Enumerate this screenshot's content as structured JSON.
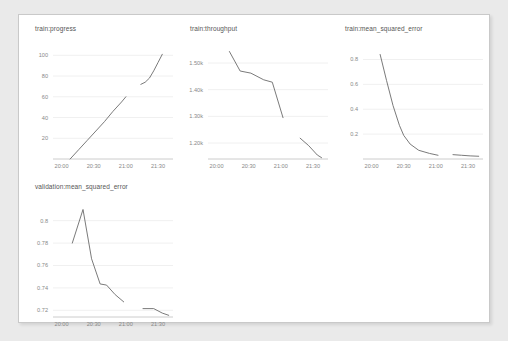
{
  "page": {
    "background_color": "#eaeaea",
    "card_background_color": "#ffffff",
    "card_border_color": "#c9c9c9"
  },
  "style": {
    "line_color": "#6b6b6b",
    "grid_color": "#f0f0f0",
    "axis_color": "#cccccc",
    "tick_label_color": "#888888",
    "title_color": "#555555"
  },
  "chart_data": [
    {
      "type": "line",
      "title": "train:progress",
      "xlabel": "",
      "ylabel": "",
      "grid": true,
      "legend": "none",
      "yticks": [
        "20",
        "40",
        "60",
        "80",
        "100"
      ],
      "ytick_values": [
        20,
        40,
        60,
        80,
        100
      ],
      "ylim": [
        0,
        108
      ],
      "xticks": [
        "20:00",
        "20:30",
        "21:00",
        "21:30"
      ],
      "xtick_values": [
        0,
        30,
        60,
        90
      ],
      "xlim": [
        -8,
        104
      ],
      "series": [
        {
          "name": "run-1",
          "x": [
            8,
            16,
            24,
            32,
            40,
            48,
            56,
            60
          ],
          "values": [
            0,
            9,
            18,
            27,
            36,
            46,
            55,
            60
          ]
        },
        {
          "name": "run-2",
          "x": [
            74,
            78,
            82,
            86,
            90,
            94
          ],
          "values": [
            72,
            74,
            78,
            85,
            93,
            101
          ]
        }
      ]
    },
    {
      "type": "line",
      "title": "train:throughput",
      "xlabel": "",
      "ylabel": "",
      "grid": true,
      "legend": "none",
      "yticks": [
        "1.20k",
        "1.30k",
        "1.40k",
        "1.50k"
      ],
      "ytick_values": [
        1200,
        1300,
        1400,
        1500
      ],
      "ylim": [
        1140,
        1560
      ],
      "xticks": [
        "20:00",
        "20:30",
        "21:00",
        "21:30"
      ],
      "xtick_values": [
        0,
        30,
        60,
        90
      ],
      "xlim": [
        -8,
        104
      ],
      "series": [
        {
          "name": "run-1",
          "x": [
            12,
            22,
            32,
            44,
            52,
            62
          ],
          "values": [
            1543,
            1470,
            1462,
            1437,
            1428,
            1295
          ]
        },
        {
          "name": "run-2",
          "x": [
            78,
            86,
            94,
            98
          ],
          "values": [
            1218,
            1190,
            1155,
            1145
          ]
        }
      ]
    },
    {
      "type": "line",
      "title": "train:mean_squared_error",
      "xlabel": "",
      "ylabel": "",
      "grid": true,
      "legend": "none",
      "yticks": [
        "0.2",
        "0.4",
        "0.6",
        "0.8"
      ],
      "ytick_values": [
        0.2,
        0.4,
        0.6,
        0.8
      ],
      "ylim": [
        0.0,
        0.9
      ],
      "xticks": [
        "20:00",
        "20:30",
        "21:00",
        "21:30"
      ],
      "xtick_values": [
        0,
        30,
        60,
        90
      ],
      "xlim": [
        -8,
        104
      ],
      "series": [
        {
          "name": "run-1",
          "x": [
            8,
            14,
            20,
            26,
            30,
            36,
            44,
            54,
            62
          ],
          "values": [
            0.84,
            0.63,
            0.43,
            0.27,
            0.19,
            0.12,
            0.07,
            0.045,
            0.03
          ]
        },
        {
          "name": "run-2",
          "x": [
            76,
            84,
            92,
            100
          ],
          "values": [
            0.035,
            0.03,
            0.025,
            0.022
          ]
        }
      ]
    },
    {
      "type": "line",
      "title": "validation:mean_squared_error",
      "xlabel": "",
      "ylabel": "",
      "grid": true,
      "legend": "none",
      "yticks": [
        "0.72",
        "0.74",
        "0.76",
        "0.78",
        "0.8"
      ],
      "ytick_values": [
        0.72,
        0.74,
        0.76,
        0.78,
        0.8
      ],
      "ylim": [
        0.714,
        0.814
      ],
      "xticks": [
        "20:00",
        "20:30",
        "21:00",
        "21:30"
      ],
      "xtick_values": [
        0,
        30,
        60,
        90
      ],
      "xlim": [
        -8,
        104
      ],
      "series": [
        {
          "name": "run-1",
          "x": [
            10,
            20,
            28,
            36,
            42,
            50,
            58
          ],
          "values": [
            0.78,
            0.81,
            0.766,
            0.7435,
            0.7425,
            0.734,
            0.7275
          ]
        },
        {
          "name": "run-2",
          "x": [
            76,
            86,
            94,
            100
          ],
          "values": [
            0.7215,
            0.7215,
            0.7175,
            0.7155
          ]
        }
      ]
    }
  ]
}
